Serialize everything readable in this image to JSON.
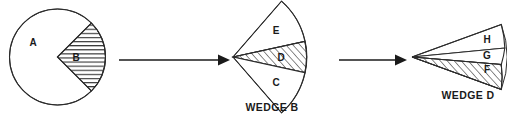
{
  "diagram": {
    "background_color": "#ffffff",
    "stroke_color": "#2b2b2b",
    "stage1": {
      "name": "whole-circle",
      "shape": "circle",
      "center": {
        "x": 57.5,
        "y": 57
      },
      "radius": 48,
      "regions": [
        {
          "id": "A",
          "label": "A",
          "hatched": false,
          "label_x": 33,
          "label_y": 43
        },
        {
          "id": "B",
          "label": "B",
          "hatched": true,
          "hatch_direction": "horizontal",
          "label_x": 76,
          "label_y": 58
        }
      ],
      "wedge_start_angle_deg": -45,
      "wedge_end_angle_deg": 45
    },
    "stage2": {
      "name": "wedge-b-expanded",
      "caption": "WEDGE B",
      "caption_x": 272,
      "caption_y": 108,
      "apex": {
        "x": 233,
        "y": 57
      },
      "radius": 74,
      "start_angle_deg": -49,
      "end_angle_deg": 49,
      "regions": [
        {
          "id": "E",
          "label": "E",
          "hatched": false,
          "label_x": 276,
          "label_y": 31
        },
        {
          "id": "D",
          "label": "D",
          "hatched": true,
          "hatch_direction": "diagonal",
          "label_x": 281,
          "label_y": 58
        },
        {
          "id": "C",
          "label": "C",
          "hatched": false,
          "label_x": 276,
          "label_y": 83
        }
      ]
    },
    "stage3": {
      "name": "wedge-d-expanded",
      "caption": "WEDGE D",
      "caption_x": 468,
      "caption_y": 96,
      "apex": {
        "x": 412,
        "y": 57
      },
      "radius": 95,
      "start_angle_deg": -20,
      "end_angle_deg": 20,
      "regions": [
        {
          "id": "H",
          "label": "H",
          "hatched": false,
          "label_x": 487,
          "label_y": 40
        },
        {
          "id": "G",
          "label": "G",
          "hatched": false,
          "label_x": 487,
          "label_y": 56
        },
        {
          "id": "F",
          "label": "F",
          "hatched": true,
          "hatch_direction": "diagonal",
          "label_x": 487,
          "label_y": 70
        }
      ]
    },
    "arrows": [
      {
        "id": "arrow-1",
        "from_x": 119,
        "to_x": 227,
        "y": 60
      },
      {
        "id": "arrow-2",
        "from_x": 339,
        "to_x": 408,
        "y": 60
      }
    ]
  }
}
